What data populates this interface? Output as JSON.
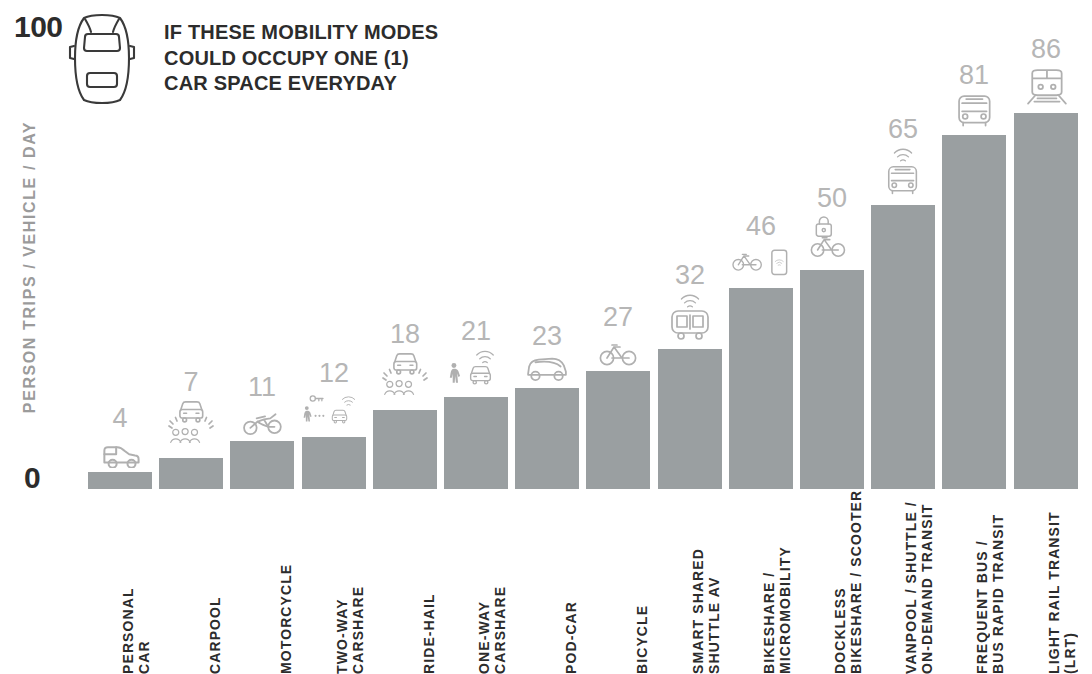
{
  "axis": {
    "y_max_label": "100",
    "y_min_label": "0",
    "y_title": "PERSON TRIPS / VEHICLE / DAY"
  },
  "callout": {
    "icon": "car-top-view-icon",
    "line1": "IF THESE MOBILITY MODES",
    "line2": "COULD OCCUPY ONE (1)",
    "line3": "CAR SPACE EVERYDAY"
  },
  "colors": {
    "bar_fill": "#9a9fa1",
    "value_label": "#b6b6b6",
    "axis_text": "#2c2c2c",
    "axis_title": "#9b9b9b",
    "icon_stroke": "#b0b0b0",
    "background": "#ffffff"
  },
  "chart_data": {
    "type": "bar",
    "title": "IF THESE MOBILITY MODES COULD OCCUPY ONE (1) CAR SPACE EVERYDAY",
    "xlabel": "",
    "ylabel": "PERSON TRIPS / VEHICLE / DAY",
    "ylim": [
      0,
      100
    ],
    "grid": false,
    "legend": "none",
    "categories": [
      "PERSONAL CAR",
      "CARPOOL",
      "MOTORCYCLE",
      "TWO-WAY CARSHARE",
      "RIDE-HAIL",
      "ONE-WAY CARSHARE",
      "POD-CAR",
      "BICYCLE",
      "SMART SHARED SHUTTLE AV",
      "BIKESHARE / MICROMOBILITY",
      "DOCKLESS BIKESHARE / SCOOTER",
      "VANPOOL / SHUTTLE / ON-DEMAND TRANSIT",
      "FREQUENT BUS / BUS RAPID TRANSIT",
      "LIGHT RAIL TRANSIT (LRT)"
    ],
    "values": [
      4,
      7,
      11,
      12,
      18,
      21,
      23,
      27,
      32,
      46,
      50,
      65,
      81,
      86
    ]
  },
  "bars": [
    {
      "value": 4,
      "value_text": "4",
      "icon": "small-car-icon",
      "label_lines": [
        "PERSONAL",
        "CAR"
      ]
    },
    {
      "value": 7,
      "value_text": "7",
      "icon": "carpool-people-car-icon",
      "label_lines": [
        "CARPOOL"
      ]
    },
    {
      "value": 11,
      "value_text": "11",
      "icon": "motorcycle-icon",
      "label_lines": [
        "MOTORCYCLE"
      ]
    },
    {
      "value": 12,
      "value_text": "12",
      "icon": "walk-key-car-wifi-icon",
      "label_lines": [
        "TWO-WAY",
        "CARSHARE"
      ]
    },
    {
      "value": 18,
      "value_text": "18",
      "icon": "ridehail-car-people-icon",
      "label_lines": [
        "RIDE-HAIL"
      ]
    },
    {
      "value": 21,
      "value_text": "21",
      "icon": "walk-car-wifi-icon",
      "label_lines": [
        "ONE-WAY",
        "CARSHARE"
      ]
    },
    {
      "value": 23,
      "value_text": "23",
      "icon": "pod-car-icon",
      "label_lines": [
        "POD-CAR"
      ]
    },
    {
      "value": 27,
      "value_text": "27",
      "icon": "bicycle-icon",
      "label_lines": [
        "BICYCLE"
      ]
    },
    {
      "value": 32,
      "value_text": "32",
      "icon": "shuttle-av-wifi-icon",
      "label_lines": [
        "SMART SHARED",
        "SHUTTLE AV"
      ]
    },
    {
      "value": 46,
      "value_text": "46",
      "icon": "bikeshare-dock-wifi-icon",
      "label_lines": [
        "BIKESHARE /",
        "MICROMOBILITY"
      ]
    },
    {
      "value": 50,
      "value_text": "50",
      "icon": "dockless-bike-lock-icon",
      "label_lines": [
        "DOCKLESS",
        "BIKESHARE / SCOOTER"
      ]
    },
    {
      "value": 65,
      "value_text": "65",
      "icon": "shuttle-bus-wifi-icon",
      "label_lines": [
        "VANPOOL / SHUTTLE /",
        "ON-DEMAND TRANSIT"
      ]
    },
    {
      "value": 81,
      "value_text": "81",
      "icon": "bus-front-icon",
      "label_lines": [
        "FREQUENT BUS /",
        "BUS RAPID TRANSIT"
      ]
    },
    {
      "value": 86,
      "value_text": "86",
      "icon": "light-rail-train-icon",
      "label_lines": [
        "LIGHT RAIL TRANSIT",
        "(LRT)"
      ]
    }
  ]
}
